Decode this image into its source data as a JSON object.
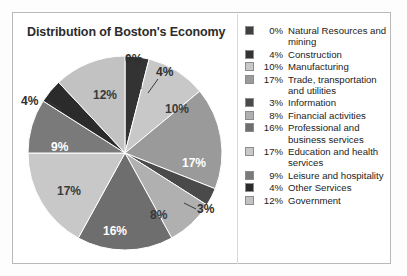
{
  "chart_data": {
    "type": "pie",
    "title": "Distribution of Boston's Economy",
    "xlabel": "",
    "ylabel": "",
    "legend_position": "right",
    "grid": false,
    "categories": [
      "Natural Resources and mining",
      "Construction",
      "Manufacturing",
      "Trade, transportation and utilities",
      "Information",
      "Financial activities",
      "Professional and business services",
      "Education and health services",
      "Leisure and hospitality",
      "Other Services",
      "Government"
    ],
    "values": [
      0,
      4,
      10,
      17,
      3,
      8,
      16,
      17,
      9,
      4,
      12
    ],
    "value_labels": [
      "0%",
      "4%",
      "10%",
      "17%",
      "3%",
      "8%",
      "16%",
      "17%",
      "9%",
      "4%",
      "12%"
    ],
    "colors": [
      "#404040",
      "#333333",
      "#c8c8c8",
      "#9a9a9a",
      "#4a4a4a",
      "#b0b0b0",
      "#6e6e6e",
      "#c8c8c8",
      "#7a7a7a",
      "#2b2b2b",
      "#c2c2c2"
    ],
    "slices": [
      {
        "label": "0%",
        "value": 0,
        "name": "Natural Resources and mining",
        "color": "#404040",
        "label_placement": "outside",
        "label_x": 108,
        "label_y": 20,
        "leader": "M 124 26 L 124 46"
      },
      {
        "label": "4%",
        "value": 4,
        "name": "Construction",
        "color": "#333333",
        "label_placement": "outside",
        "label_x": 139,
        "label_y": 33,
        "leader": "M 141 36 L 131 50"
      },
      {
        "label": "10%",
        "value": 10,
        "name": "Manufacturing",
        "color": "#c8c8c8",
        "label_placement": "on-light",
        "label_x": 148,
        "label_y": 70
      },
      {
        "label": "17%",
        "value": 17,
        "name": "Trade, transportation and utilities",
        "color": "#9a9a9a",
        "label_placement": "on-dark",
        "label_x": 165,
        "label_y": 124
      },
      {
        "label": "3%",
        "value": 3,
        "name": "Information",
        "color": "#4a4a4a",
        "label_placement": "outside",
        "label_x": 180,
        "label_y": 170,
        "leader": "M 179 166 L 167 160"
      },
      {
        "label": "8%",
        "value": 8,
        "name": "Financial activities",
        "color": "#b0b0b0",
        "label_placement": "on-light",
        "label_x": 133,
        "label_y": 176
      },
      {
        "label": "16%",
        "value": 16,
        "name": "Professional and business services",
        "color": "#6e6e6e",
        "label_placement": "on-dark",
        "label_x": 86,
        "label_y": 192
      },
      {
        "label": "17%",
        "value": 17,
        "name": "Education and health services",
        "color": "#c8c8c8",
        "label_placement": "on-light",
        "label_x": 40,
        "label_y": 152
      },
      {
        "label": "9%",
        "value": 9,
        "name": "Leisure and hospitality",
        "color": "#7a7a7a",
        "label_placement": "on-dark",
        "label_x": 34,
        "label_y": 108
      },
      {
        "label": "4%",
        "value": 4,
        "name": "Other Services",
        "color": "#2b2b2b",
        "label_placement": "outside",
        "label_x": 4,
        "label_y": 62,
        "leader": "M 30 58 L 44 66"
      },
      {
        "label": "12%",
        "value": 12,
        "name": "Government",
        "color": "#c2c2c2",
        "label_placement": "on-light",
        "label_x": 76,
        "label_y": 56
      }
    ]
  },
  "legend": {
    "items": [
      {
        "pct": "0%",
        "name": "Natural Resources and mining",
        "color": "#404040"
      },
      {
        "pct": "4%",
        "name": "Construction",
        "color": "#333333"
      },
      {
        "pct": "10%",
        "name": "Manufacturing",
        "color": "#c8c8c8"
      },
      {
        "pct": "17%",
        "name": "Trade, transportation and utilities",
        "color": "#9a9a9a"
      },
      {
        "pct": "3%",
        "name": "Information",
        "color": "#4a4a4a"
      },
      {
        "pct": "8%",
        "name": "Financial activities",
        "color": "#b0b0b0"
      },
      {
        "pct": "16%",
        "name": "Professional and business services",
        "color": "#6e6e6e"
      },
      {
        "pct": "17%",
        "name": "Education and health services",
        "color": "#c8c8c8"
      },
      {
        "pct": "9%",
        "name": "Leisure and hospitality",
        "color": "#7a7a7a"
      },
      {
        "pct": "4%",
        "name": "Other Services",
        "color": "#2b2b2b"
      },
      {
        "pct": "12%",
        "name": "Government",
        "color": "#c2c2c2"
      }
    ]
  }
}
